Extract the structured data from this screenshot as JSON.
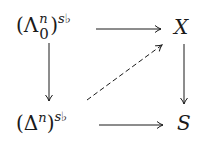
{
  "diagram": {
    "nodes": {
      "top_left": {
        "open": "(",
        "base": "Λ",
        "sup_inner": "n",
        "sub_inner": "0",
        "close": ")",
        "sup_outer": "s♭"
      },
      "top_right": {
        "label": "X"
      },
      "bottom_left": {
        "open": "(",
        "base": "Δ",
        "sup_inner": "n",
        "close": ")",
        "sup_outer": "s♭"
      },
      "bottom_right": {
        "label": "S"
      }
    },
    "arrows": [
      {
        "from": "top_left",
        "to": "top_right",
        "style": "solid"
      },
      {
        "from": "top_left",
        "to": "bottom_left",
        "style": "solid"
      },
      {
        "from": "top_right",
        "to": "bottom_right",
        "style": "solid"
      },
      {
        "from": "bottom_left",
        "to": "bottom_right",
        "style": "solid"
      },
      {
        "from": "bottom_left",
        "to": "top_right",
        "style": "dashed"
      }
    ],
    "color": "#1a1a1a"
  }
}
